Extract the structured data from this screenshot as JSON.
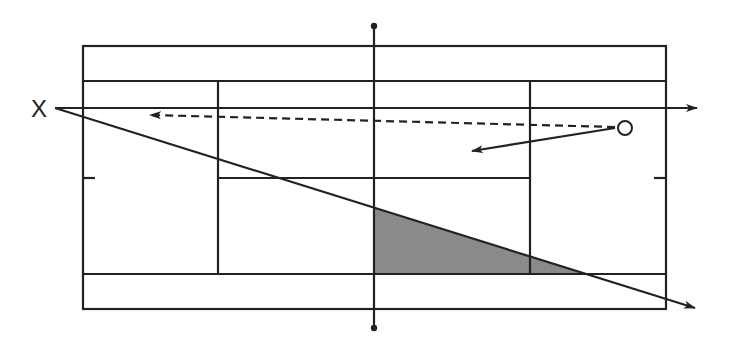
{
  "diagram": {
    "labels": {
      "player_x": "X",
      "player_o": "O"
    },
    "colors": {
      "line": "#222222",
      "shade": "#8a8a8a",
      "background": "#ffffff"
    },
    "court": {
      "outer": {
        "x1": 83,
        "y1": 46,
        "x2": 666,
        "y2": 309
      },
      "singles_top_y": 81,
      "singles_bottom_y": 274,
      "service_line_left_x": 218,
      "service_line_right_x": 530,
      "center_service_y": 178,
      "net_x": 374,
      "net_top_y": 26,
      "net_bottom_y": 328
    },
    "elements": [
      {
        "type": "arrow",
        "style": "solid",
        "from": [
          55,
          108
        ],
        "to": [
          697,
          108
        ],
        "description": "horizontal line from X"
      },
      {
        "type": "arrow",
        "style": "solid",
        "from": [
          55,
          108
        ],
        "to": [
          695,
          308
        ],
        "description": "diagonal line from X"
      },
      {
        "type": "arrow",
        "style": "dashed",
        "from": [
          615,
          127
        ],
        "to": [
          150,
          115
        ],
        "description": "dashed shot from O"
      },
      {
        "type": "arrow",
        "style": "solid",
        "from": [
          615,
          128
        ],
        "to": [
          472,
          151
        ],
        "description": "short shot from O"
      },
      {
        "type": "shaded-region",
        "points": [
          [
            374,
            208
          ],
          [
            374,
            274
          ],
          [
            585,
            274
          ]
        ],
        "description": "shaded target area"
      }
    ]
  }
}
